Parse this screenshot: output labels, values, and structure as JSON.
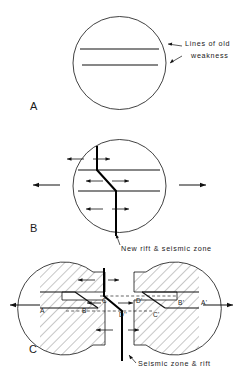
{
  "figure": {
    "type": "geological-diagram",
    "background_color": "#ffffff",
    "line_color": "#111111",
    "hatch_color": "#333333",
    "panels": [
      {
        "id": "A",
        "letter": "A",
        "letter_x": 30,
        "letter_y": 110,
        "callout": {
          "line1": "Lines of old",
          "line2": "weakness"
        }
      },
      {
        "id": "B",
        "letter": "B",
        "letter_x": 30,
        "letter_y": 232,
        "callout": {
          "line1": "New rift & seismic zone"
        }
      },
      {
        "id": "C",
        "letter": "C",
        "letter_x": 29,
        "letter_y": 353,
        "callout": {
          "line1": "Seismic zone & rift"
        },
        "point_labels": [
          {
            "text": "A",
            "x": 40,
            "y": 313
          },
          {
            "text": "B",
            "x": 82,
            "y": 313
          },
          {
            "text": "C",
            "x": 102,
            "y": 303
          },
          {
            "text": "D'",
            "x": 136,
            "y": 303
          },
          {
            "text": "D''",
            "x": 119,
            "y": 317
          },
          {
            "text": "C'",
            "x": 153,
            "y": 317
          },
          {
            "text": "B'",
            "x": 178,
            "y": 305
          },
          {
            "text": "A'",
            "x": 201,
            "y": 305
          }
        ]
      }
    ]
  }
}
